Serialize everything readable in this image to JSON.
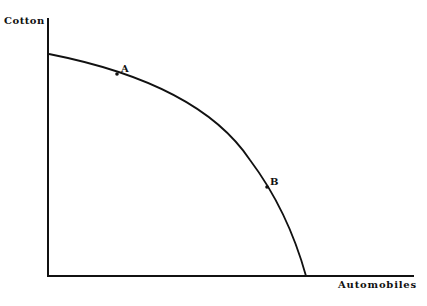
{
  "diagram": {
    "type": "production-possibilities-frontier",
    "y_axis_label": "Cotton",
    "x_axis_label": "Automobiles",
    "points": [
      {
        "label": "A",
        "x": 117,
        "y": 74
      },
      {
        "label": "B",
        "x": 267,
        "y": 187
      }
    ],
    "line_color": "#111111"
  }
}
